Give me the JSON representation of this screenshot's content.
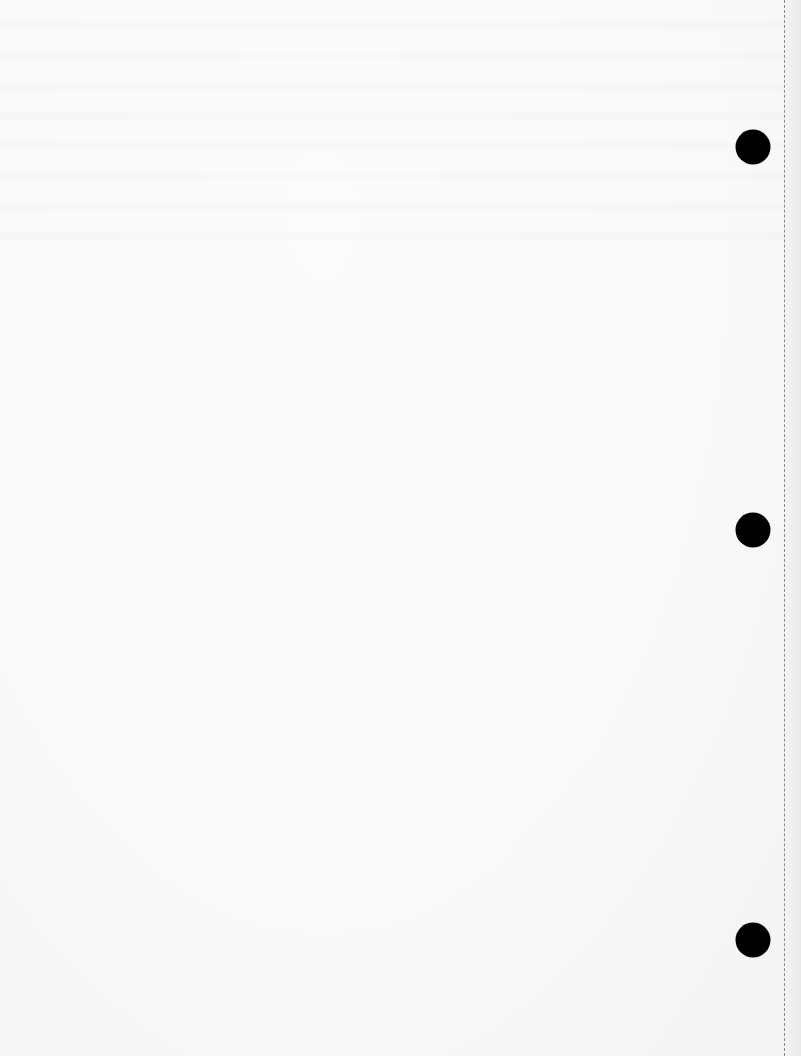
{
  "page": {
    "type": "scanned blank page",
    "background_color": "#f9f9f9",
    "content_text": ""
  },
  "punch_holes": [
    {
      "x": 753,
      "y": 147,
      "diameter": 35,
      "color": "#000000"
    },
    {
      "x": 753,
      "y": 530,
      "diameter": 35,
      "color": "#000000"
    },
    {
      "x": 753,
      "y": 940,
      "diameter": 35,
      "color": "#000000"
    }
  ],
  "perforation": {
    "x": 784,
    "style": "dashed",
    "color": "#8a8a8a"
  }
}
